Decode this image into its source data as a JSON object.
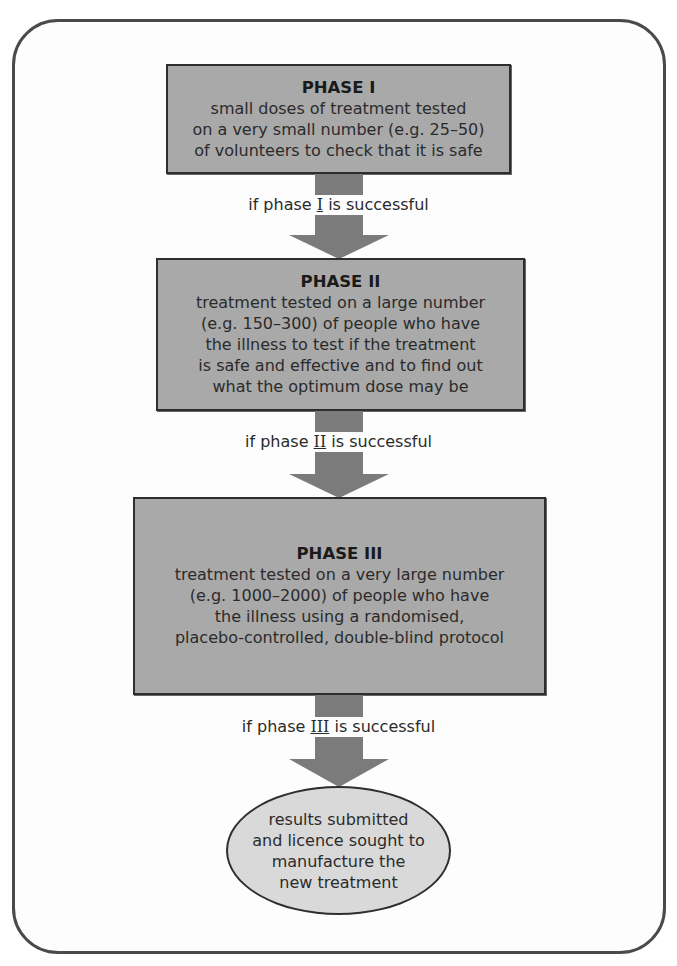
{
  "diagram": {
    "type": "flowchart",
    "phases": [
      {
        "title": "PHASE I",
        "description": "small doses of treatment tested\non a very small number (e.g. 25–50)\nof volunteers to check that it is safe"
      },
      {
        "title": "PHASE II",
        "description": "treatment tested on a large number\n(e.g. 150–300) of people who have\nthe illness to test if the treatment\nis safe and effective and to find out\nwhat the optimum dose may be"
      },
      {
        "title": "PHASE III",
        "description": "treatment tested on a very large number\n(e.g. 1000–2000) of people who have\nthe illness using a randomised,\nplacebo-controlled, double-blind protocol"
      }
    ],
    "transitions": [
      {
        "prefix": "if phase ",
        "numeral": "I",
        "suffix": " is successful"
      },
      {
        "prefix": "if phase ",
        "numeral": "II",
        "suffix": " is successful"
      },
      {
        "prefix": "if phase ",
        "numeral": "III",
        "suffix": " is successful"
      }
    ],
    "outcome": {
      "description": "results submitted\nand licence sought to\nmanufacture the\nnew treatment"
    },
    "colors": {
      "box_fill": "#a9a9a9",
      "arrow_fill": "#7b7b7b",
      "outcome_fill": "#d9d9d9",
      "border": "#2e2e2e",
      "frame": "#4a4a4a"
    }
  }
}
